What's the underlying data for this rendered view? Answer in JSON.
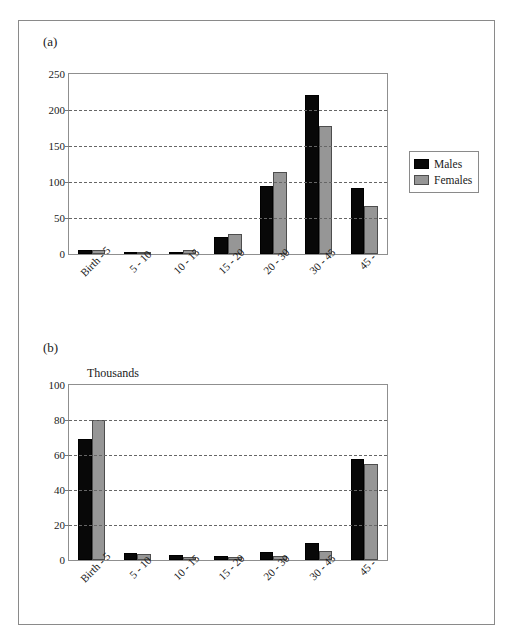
{
  "figure": {
    "panel_a_tag": "(a)",
    "panel_b_tag": "(b)",
    "panel_b_unit_label": "Thousands"
  },
  "legend": {
    "series": [
      {
        "name": "Males",
        "color": "#080808"
      },
      {
        "name": "Females",
        "color": "#969696"
      }
    ]
  },
  "chart_data": [
    {
      "id": "panel-a",
      "type": "bar",
      "title": "(a)",
      "xlabel": "",
      "ylabel": "",
      "ylim": [
        0,
        250
      ],
      "yticks": [
        0,
        50,
        100,
        150,
        200,
        250
      ],
      "grid": true,
      "legend_position": "right",
      "categories": [
        "Birth - 5",
        "5 - 10",
        "10 - 15",
        "15 - 20",
        "20 - 30",
        "30 - 45",
        "45 -"
      ],
      "series": [
        {
          "name": "Males",
          "color": "#080808",
          "values": [
            5,
            2,
            2,
            23,
            95,
            221,
            92
          ]
        },
        {
          "name": "Females",
          "color": "#969696",
          "values": [
            5,
            2,
            5,
            28,
            114,
            178,
            66
          ]
        }
      ]
    },
    {
      "id": "panel-b",
      "type": "bar",
      "title": "(b)",
      "xlabel": "",
      "ylabel": "Thousands",
      "ylim": [
        0,
        100
      ],
      "yticks": [
        0,
        20,
        40,
        60,
        80,
        100
      ],
      "grid": true,
      "legend_position": "right",
      "categories": [
        "Birth - 5",
        "5 - 10",
        "10 - 15",
        "15 - 20",
        "20 - 30",
        "30 - 45",
        "45 -"
      ],
      "series": [
        {
          "name": "Males",
          "color": "#080808",
          "values": [
            69,
            4,
            3,
            2.5,
            4.5,
            9.5,
            58
          ]
        },
        {
          "name": "Females",
          "color": "#969696",
          "values": [
            80,
            3.5,
            2,
            1.5,
            2.5,
            5,
            55
          ]
        }
      ]
    }
  ]
}
